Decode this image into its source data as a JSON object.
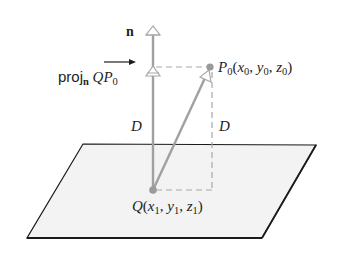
{
  "figure": {
    "colors": {
      "plane_fill": "#f2f2f2",
      "plane_edge": "#1a1a1a",
      "vector": "#a0a0a0",
      "dashed": "#a8a8a8",
      "point": "#9a9a9a",
      "text": "#1e1e1e"
    },
    "labels": {
      "normal": "n",
      "proj_prefix": "proj",
      "proj_sub": "n",
      "proj_vector": "QP",
      "proj_vector_sub": "0",
      "p0_name": "P",
      "p0_name_sub": "0",
      "p0_coords_open": "(",
      "p0_x": "x",
      "p0_x_sub": "0",
      "p0_y": "y",
      "p0_y_sub": "0",
      "p0_z": "z",
      "p0_z_sub": "0",
      "p0_coords_close": ")",
      "d_left": "D",
      "d_right": "D",
      "q_name": "Q",
      "q_coords_open": "(",
      "q_x": "x",
      "q_x_sub": "1",
      "q_y": "y",
      "q_y_sub": "1",
      "q_z": "z",
      "q_z_sub": "1",
      "q_coords_close": ")",
      "comma": ", "
    },
    "points": {
      "Q": [
        153,
        190
      ],
      "P0": [
        210,
        67
      ],
      "plane_corners": [
        [
          83,
          144
        ],
        [
          316,
          145
        ],
        [
          262,
          238
        ],
        [
          27,
          238
        ]
      ]
    }
  }
}
